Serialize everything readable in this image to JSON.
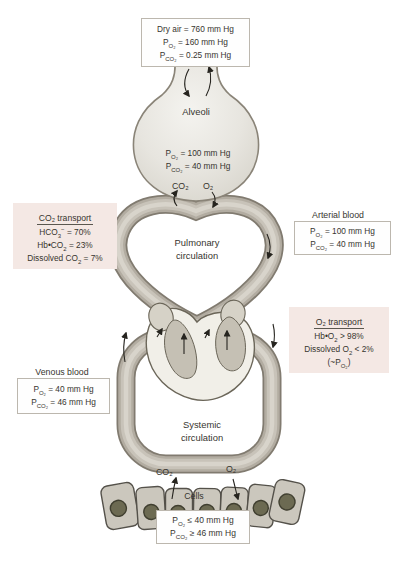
{
  "colors": {
    "background": "#ffffff",
    "tube_outline": "#817b70",
    "tube_mid": "#b2aca1",
    "tube_light": "#d8d4cb",
    "alveoli_fill": "#e7e5df",
    "heart_cream": "#f1efe8",
    "chamber_beige": "#c5c0b4",
    "pink_box": "#f4e8e4",
    "white_box_border": "#bcb7ae",
    "cell_fill": "#cbc7bd",
    "nucleus": "#6c6a52",
    "text": "#37352f",
    "arrow": "#26241f"
  },
  "dry_air_box": {
    "lines": [
      {
        "p": "Dry air",
        "s": "",
        "v": " = 760 mm Hg"
      },
      {
        "p": "P",
        "s": "O₂",
        "v": " = 160 mm Hg"
      },
      {
        "p": "P",
        "s": "CO₂",
        "v": " = 0.25 mm Hg"
      }
    ]
  },
  "alveoli": {
    "label": "Alveoli",
    "lines": [
      {
        "p": "P",
        "s": "O₂",
        "v": " = 100 mm Hg"
      },
      {
        "p": "P",
        "s": "CO₂",
        "v": " = 40 mm Hg"
      }
    ],
    "gas_out": "CO₂",
    "gas_in": "O₂"
  },
  "pulmonary": {
    "label": "Pulmonary\ncirculation"
  },
  "co2_transport": {
    "title": "CO₂ transport",
    "lines": [
      {
        "p": "HCO",
        "s": "3",
        "sup": "−",
        "v": " = 70%"
      },
      {
        "p": "Hb•CO",
        "s": "2",
        "sup": "",
        "v": " = 23%"
      },
      {
        "p": "Dissolved CO",
        "s": "2",
        "sup": "",
        "v": " = 7%"
      }
    ]
  },
  "arterial": {
    "heading": "Arterial blood",
    "lines": [
      {
        "p": "P",
        "s": "O₂",
        "v": " = 100 mm Hg"
      },
      {
        "p": "P",
        "s": "CO₂",
        "v": " = 40 mm Hg"
      }
    ]
  },
  "o2_transport": {
    "title": "O₂ transport",
    "lines": [
      {
        "p": "Hb•O",
        "s": "2",
        "sup": "",
        "v": " > 98%"
      },
      {
        "p": "Dissolved O",
        "s": "2",
        "sup": "",
        "v": " < 2%"
      },
      {
        "p": "(~P",
        "s": "O₂",
        "sup": "",
        "v": ")"
      }
    ]
  },
  "venous": {
    "heading": "Venous blood",
    "lines": [
      {
        "p": "P",
        "s": "O₂",
        "v": " = 40 mm Hg"
      },
      {
        "p": "P",
        "s": "CO₂",
        "v": " = 46 mm Hg"
      }
    ]
  },
  "systemic": {
    "label": "Systemic\ncirculation",
    "gas_out": "CO₂",
    "gas_in": "O₂"
  },
  "cells": {
    "label": "Cells",
    "lines": [
      {
        "p": "P",
        "s": "O₂",
        "v": " ≤ 40 mm Hg"
      },
      {
        "p": "P",
        "s": "CO₂",
        "v": " ≥ 46 mm Hg"
      }
    ]
  }
}
